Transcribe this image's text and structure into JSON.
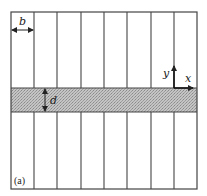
{
  "figure": {
    "panel_label": "(a)",
    "labels": {
      "column_width": "b",
      "band_thickness": "d",
      "x_axis": "x",
      "y_axis": "y"
    },
    "frame": {
      "left": 11,
      "top": 12,
      "right": 197,
      "bottom": 189
    },
    "column_lines_x": [
      34,
      57,
      81,
      104,
      127,
      151,
      174
    ],
    "band": {
      "top": 88,
      "bottom": 112,
      "fill": "#b8b8b8"
    },
    "colors": {
      "line": "#444444",
      "band_fill": "#b8b8b8",
      "background": "#ffffff"
    }
  }
}
